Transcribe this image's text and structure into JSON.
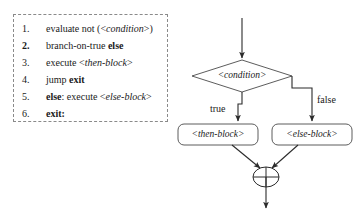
{
  "figure": {
    "type": "control-flow-diagram"
  },
  "pseudocode": {
    "border_style": "dashed",
    "border_color": "#8a8a8a",
    "lines": [
      {
        "number": "1.",
        "number_bold": false,
        "parts": [
          {
            "text": "evaluate not (<",
            "style": "plain"
          },
          {
            "text": "condition",
            "style": "italic"
          },
          {
            "text": ">)",
            "style": "plain"
          }
        ]
      },
      {
        "number": "2.",
        "number_bold": true,
        "parts": [
          {
            "text": "branch-on-true  ",
            "style": "plain"
          },
          {
            "text": "else",
            "style": "bold"
          }
        ]
      },
      {
        "number": "3.",
        "number_bold": false,
        "parts": [
          {
            "text": "execute <",
            "style": "plain"
          },
          {
            "text": "then-block",
            "style": "italic"
          },
          {
            "text": ">",
            "style": "plain"
          }
        ]
      },
      {
        "number": "4.",
        "number_bold": false,
        "parts": [
          {
            "text": "jump  ",
            "style": "plain"
          },
          {
            "text": "exit",
            "style": "bold"
          }
        ]
      },
      {
        "number": "5.",
        "number_bold": false,
        "parts": [
          {
            "text": "else",
            "style": "bold"
          },
          {
            "text": ": execute <",
            "style": "plain"
          },
          {
            "text": "else-block",
            "style": "italic"
          },
          {
            "text": ">",
            "style": "plain"
          }
        ]
      },
      {
        "number": "6.",
        "number_bold": false,
        "parts": [
          {
            "text": "exit:",
            "style": "bold"
          }
        ]
      }
    ]
  },
  "flowchart": {
    "stroke_color": "#2b2b2b",
    "fill_color": "#ffffff",
    "nodes": {
      "decision": {
        "label": "<condition>",
        "shape": "diamond",
        "italic": true
      },
      "then_block": {
        "label": "<then-block>",
        "shape": "rounded-rect",
        "italic": true
      },
      "else_block": {
        "label": "<else-block>",
        "shape": "rounded-rect",
        "italic": true
      },
      "merge": {
        "label": "merge",
        "shape": "circle-with-cross",
        "symbol": "⊕"
      }
    },
    "edge_labels": {
      "true_branch": "true",
      "false_branch": "false"
    },
    "entry_arrow": "down-into-decision",
    "exit_arrow": "down-out-of-merge"
  }
}
